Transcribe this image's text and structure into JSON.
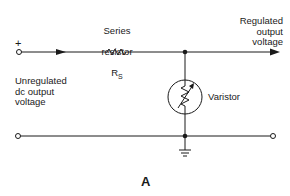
{
  "diagram": {
    "figure_label": "A",
    "labels": {
      "plus": "+",
      "series_resistor_line1": "Series",
      "series_resistor_line2": "resistor",
      "rs_main": "R",
      "rs_sub": "S",
      "input": "Unregulated\ndc output\nvoltage",
      "output": "Regulated\noutput\nvoltage",
      "varistor": "Varistor"
    },
    "components": [
      {
        "type": "input-terminal-positive",
        "x": 19,
        "y": 52
      },
      {
        "type": "input-terminal-negative",
        "x": 18,
        "y": 136
      },
      {
        "type": "series-resistor",
        "label": "RS"
      },
      {
        "type": "junction-top",
        "x": 185,
        "y": 52
      },
      {
        "type": "varistor"
      },
      {
        "type": "junction-bottom",
        "x": 185,
        "y": 136
      },
      {
        "type": "ground"
      },
      {
        "type": "output-arrow",
        "x": 278,
        "y": 52
      },
      {
        "type": "output-terminal",
        "x": 273,
        "y": 136
      }
    ],
    "colors": {
      "line": "#1a1a1a",
      "background": "#ffffff"
    }
  }
}
